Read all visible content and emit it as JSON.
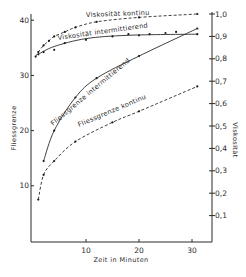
{
  "chart_data": {
    "type": "line",
    "title": "",
    "xlabel": "Zeit in Minuten",
    "ylabel_left": "Fliessgrenze",
    "ylabel_right": "Viskosität",
    "xlim": [
      0,
      33
    ],
    "ylim_left": [
      0,
      42
    ],
    "ylim_right": [
      0,
      1.02
    ],
    "x_ticks": [
      10,
      20,
      30
    ],
    "x_tick_labels": [
      "10",
      "20",
      "30"
    ],
    "y_left_ticks": [
      10,
      20,
      30,
      40
    ],
    "y_left_tick_labels": [
      "10",
      "20",
      "30",
      "40"
    ],
    "y_right_ticks": [
      0.1,
      0.2,
      0.3,
      0.4,
      0.5,
      0.6,
      0.7,
      0.8,
      0.9,
      1.0
    ],
    "y_right_tick_labels": [
      "0,1",
      "0,2",
      "0,3",
      "0,4",
      "0,5",
      "0,6",
      "0,7",
      "0,8",
      "0,9",
      "1,0"
    ],
    "grid": false,
    "legend": "none (curves labelled inline)",
    "series": [
      {
        "name": "Viskosität kontinu",
        "axis": "right",
        "style": "dashed",
        "x": [
          0.5,
          1,
          2,
          3,
          4,
          6,
          8,
          12,
          20,
          31
        ],
        "values": [
          0.81,
          0.83,
          0.86,
          0.88,
          0.9,
          0.92,
          0.94,
          0.965,
          0.985,
          1.0
        ]
      },
      {
        "name": "Viskosität intermittierend",
        "axis": "right",
        "style": "solid",
        "x": [
          1,
          2,
          4,
          6,
          10,
          15,
          18,
          20,
          22,
          25,
          27,
          31
        ],
        "values": [
          0.82,
          0.83,
          0.84,
          0.87,
          0.885,
          0.9,
          0.91,
          0.905,
          0.91,
          0.915,
          0.92,
          0.91
        ]
      },
      {
        "name": "Fliessgrenze intermittierend",
        "axis": "left",
        "style": "solid",
        "x": [
          2,
          4,
          8,
          12,
          20,
          31
        ],
        "values": [
          14.5,
          20,
          26,
          29.5,
          33.5,
          38.5
        ]
      },
      {
        "name": "Fliessgrenze kontinu",
        "axis": "left",
        "style": "dashed",
        "x": [
          1,
          2,
          4,
          8,
          15,
          20,
          31
        ],
        "values": [
          7.5,
          12,
          14.5,
          18,
          21.5,
          23.5,
          28
        ]
      }
    ]
  },
  "labels": {
    "curve_viskositaet_kontinu": "Viskosität kontinu",
    "curve_viskositaet_intermittierend": "Viskosität intermittierend",
    "curve_fliessgrenze_intermittierend": "Fliessgrenze intermittierend",
    "curve_fliessgrenze_kontinu": "Fliessgrenze kontinu"
  }
}
